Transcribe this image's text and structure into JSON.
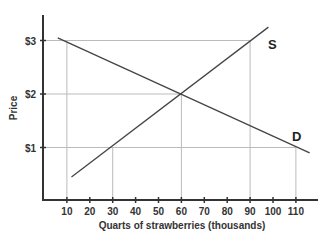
{
  "chart_data": {
    "type": "line",
    "title": "",
    "xlabel": "Quarts of strawberries (thousands)",
    "ylabel": "Price",
    "x_ticks": [
      "10",
      "20",
      "30",
      "40",
      "50",
      "60",
      "70",
      "80",
      "90",
      "100",
      "110"
    ],
    "y_ticks": [
      "$1",
      "$2",
      "$3"
    ],
    "xlim": [
      0,
      120
    ],
    "ylim": [
      0,
      3.5
    ],
    "grid": "reference lines only",
    "series": [
      {
        "name": "S",
        "label": "S",
        "type": "supply",
        "points": [
          [
            12,
            0.45
          ],
          [
            98,
            3.25
          ]
        ]
      },
      {
        "name": "D",
        "label": "D",
        "type": "demand",
        "points": [
          [
            6,
            3.05
          ],
          [
            116,
            0.9
          ]
        ]
      }
    ],
    "reference_lines": {
      "horizontal": [
        1,
        2,
        3
      ],
      "vertical": [
        10,
        30,
        60,
        90,
        110
      ]
    },
    "equilibrium": {
      "quantity": 60,
      "price": 2
    }
  },
  "axes": {
    "x_title": "Quarts of strawberries (thousands)",
    "y_title": "Price",
    "x_tick_labels": [
      "10",
      "20",
      "30",
      "40",
      "50",
      "60",
      "70",
      "80",
      "90",
      "100",
      "110"
    ],
    "y_tick_labels": [
      "$1",
      "$2",
      "$3"
    ]
  },
  "labels": {
    "supply": "S",
    "demand": "D"
  },
  "colors": {
    "axis": "#333333",
    "curve": "#444444",
    "gridline": "#bbbbbb"
  }
}
